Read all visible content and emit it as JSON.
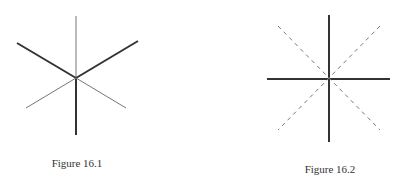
{
  "figures": [
    {
      "caption": "Figure 16.1",
      "caption_pos": {
        "x": 77,
        "y": 158
      },
      "center": {
        "x": 76,
        "y": 78
      },
      "lines": [
        {
          "name": "upper-vertical-thin-line",
          "x1": 76,
          "y1": 16,
          "x2": 76,
          "y2": 78,
          "width": 1,
          "color": "#777777",
          "dashed": false
        },
        {
          "name": "lower-vertical-thick-line",
          "x1": 76,
          "y1": 78,
          "x2": 76,
          "y2": 135,
          "width": 2,
          "color": "#333333",
          "dashed": false
        },
        {
          "name": "upper-left-thick-line",
          "x1": 17,
          "y1": 43,
          "x2": 76,
          "y2": 78,
          "width": 2,
          "color": "#333333",
          "dashed": false
        },
        {
          "name": "upper-right-thick-line",
          "x1": 138,
          "y1": 41,
          "x2": 76,
          "y2": 78,
          "width": 2,
          "color": "#333333",
          "dashed": false
        },
        {
          "name": "lower-left-thin-line",
          "x1": 26,
          "y1": 108,
          "x2": 76,
          "y2": 78,
          "width": 1,
          "color": "#777777",
          "dashed": false
        },
        {
          "name": "lower-right-thin-line",
          "x1": 126,
          "y1": 108,
          "x2": 76,
          "y2": 78,
          "width": 1,
          "color": "#777777",
          "dashed": false
        }
      ]
    },
    {
      "caption": "Figure 16.2",
      "caption_pos": {
        "x": 330,
        "y": 164
      },
      "center": {
        "x": 329,
        "y": 79
      },
      "lines": [
        {
          "name": "vertical-solid-line",
          "x1": 329,
          "y1": 15,
          "x2": 329,
          "y2": 142,
          "width": 2,
          "color": "#333333",
          "dashed": false
        },
        {
          "name": "horizontal-solid-line",
          "x1": 267,
          "y1": 79,
          "x2": 390,
          "y2": 79,
          "width": 2,
          "color": "#333333",
          "dashed": false
        },
        {
          "name": "diagonal-dashed-line-1",
          "x1": 278,
          "y1": 26,
          "x2": 380,
          "y2": 130,
          "width": 1,
          "color": "#777777",
          "dashed": true
        },
        {
          "name": "diagonal-dashed-line-2",
          "x1": 380,
          "y1": 26,
          "x2": 278,
          "y2": 130,
          "width": 1,
          "color": "#777777",
          "dashed": true
        }
      ]
    }
  ]
}
